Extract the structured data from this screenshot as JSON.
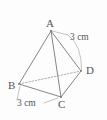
{
  "figure": {
    "name": "tetrahedron-abcd",
    "type": "geometry-diagram",
    "background_color": "#fdfdfd",
    "stroke_color": "#77777c",
    "label_color": "#555558",
    "vertices": [
      {
        "id": "A",
        "label": "A",
        "x": 51,
        "y": 31,
        "role": "apex"
      },
      {
        "id": "B",
        "label": "B",
        "x": 19,
        "y": 84,
        "role": "base"
      },
      {
        "id": "C",
        "label": "C",
        "x": 61,
        "y": 97,
        "role": "base"
      },
      {
        "id": "D",
        "label": "D",
        "x": 81,
        "y": 71,
        "role": "base"
      }
    ],
    "edges": [
      {
        "id": "AB",
        "from": "A",
        "to": "B",
        "style": "solid"
      },
      {
        "id": "AC",
        "from": "A",
        "to": "C",
        "style": "solid"
      },
      {
        "id": "AD",
        "from": "A",
        "to": "D",
        "style": "solid"
      },
      {
        "id": "BC",
        "from": "B",
        "to": "C",
        "style": "solid"
      },
      {
        "id": "CD",
        "from": "C",
        "to": "D",
        "style": "solid"
      },
      {
        "id": "BD",
        "from": "B",
        "to": "D",
        "style": "dashed",
        "hidden": true
      }
    ],
    "measurements": [
      {
        "id": "len-ad",
        "edge": "AD",
        "value": "3 cm",
        "leader": "arc",
        "position": "right"
      },
      {
        "id": "len-bc",
        "edge": "BC",
        "value": "3 cm",
        "leader": "line",
        "position": "below-left"
      }
    ]
  }
}
